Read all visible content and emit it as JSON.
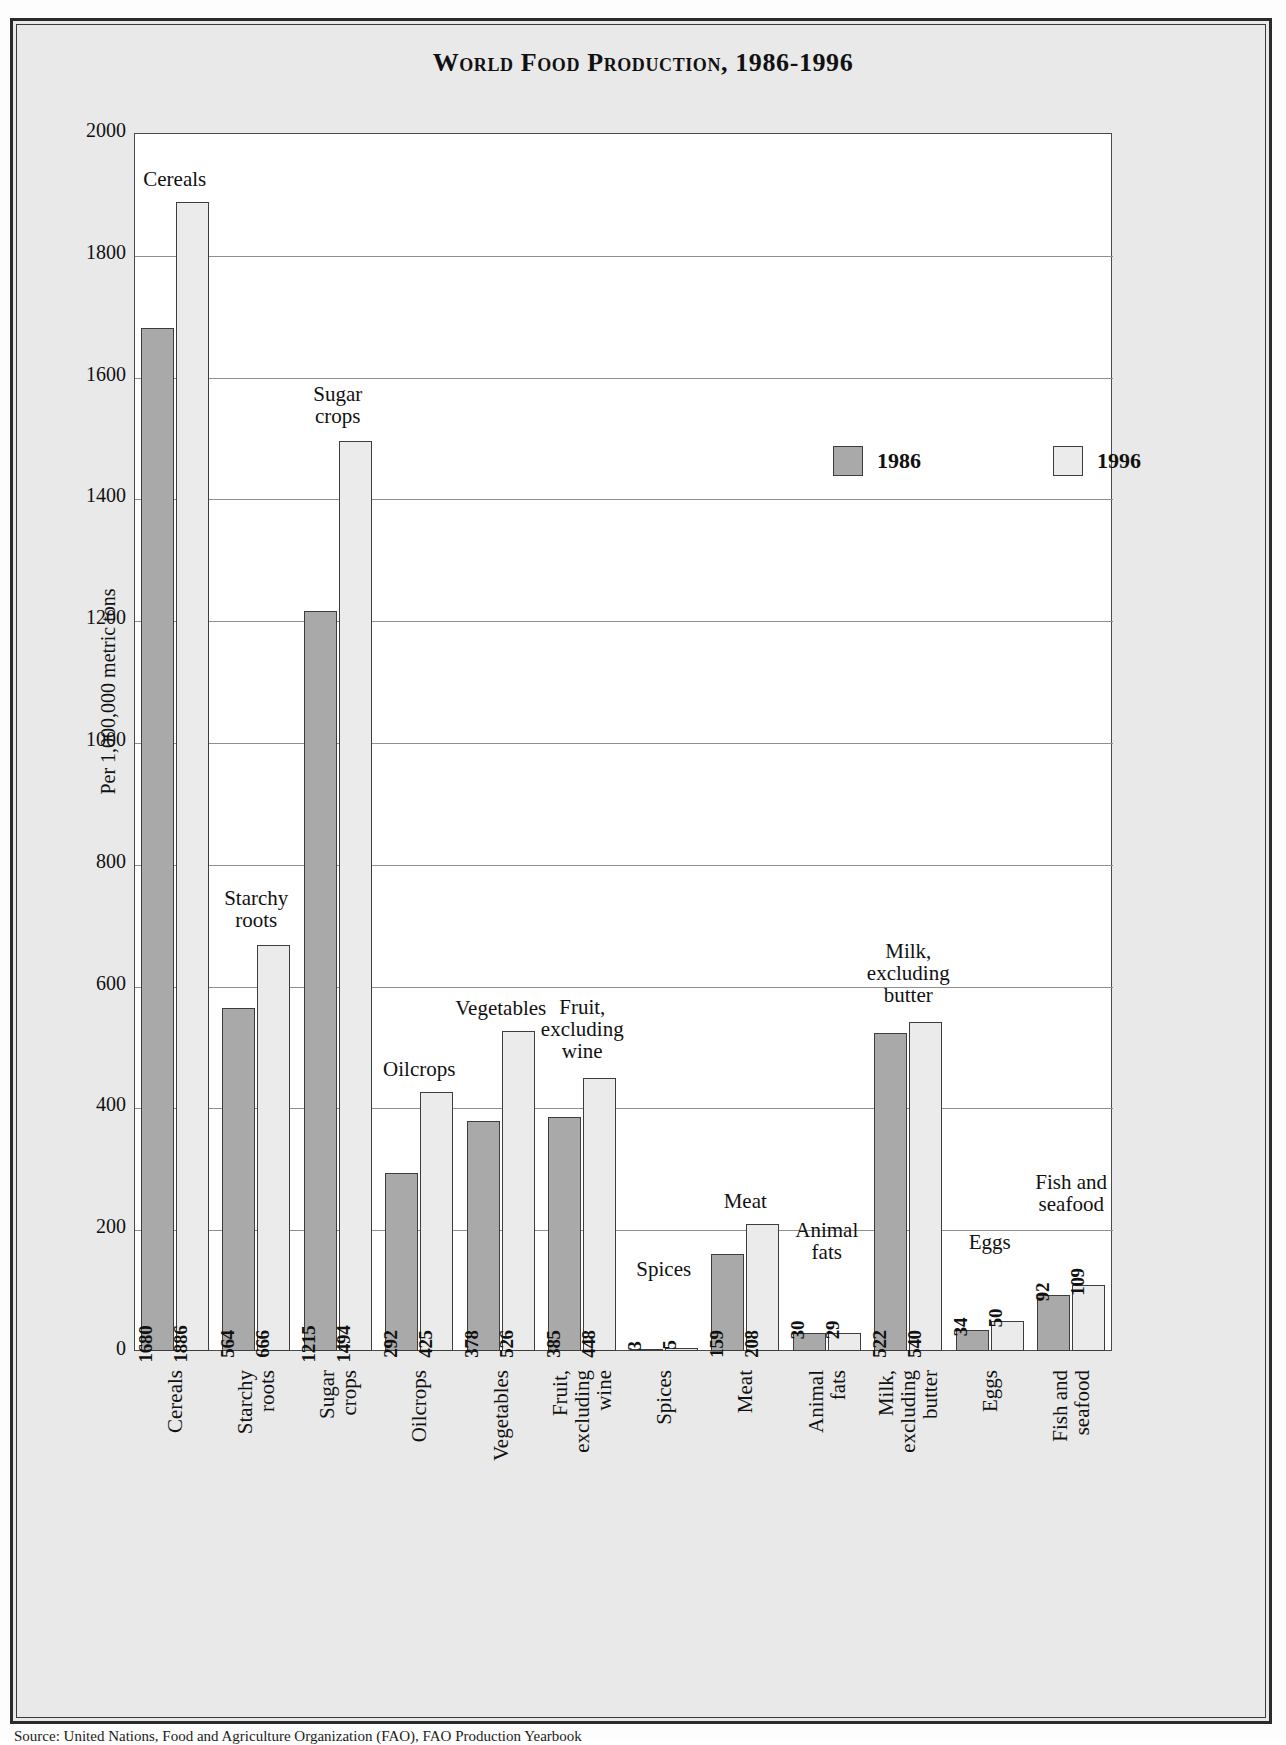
{
  "title": "World Food Production, 1986-1996",
  "source_caption": "Source: United Nations, Food and Agriculture Organization (FAO), FAO Production Yearbook",
  "legend": {
    "items": [
      {
        "label": "1986",
        "color": "#a9a9a9"
      },
      {
        "label": "1996",
        "color": "#ebebeb"
      }
    ]
  },
  "axis": {
    "y_title": "Per 1,000,000 metric tons",
    "y_ticks": [
      "2000",
      "1800",
      "1600",
      "1400",
      "1200",
      "1000",
      "800",
      "600",
      "400",
      "200",
      "0"
    ]
  },
  "chart_data": {
    "type": "bar",
    "title": "World Food Production, 1986-1996",
    "xlabel": "",
    "ylabel": "Per 1,000,000 metric tons",
    "ylim": [
      0,
      2000
    ],
    "ytick_step": 200,
    "grid": true,
    "legend_position": "upper-right-inside",
    "categories": [
      "Cereals",
      "Starchy roots",
      "Sugar crops",
      "Oilcrops",
      "Vegetables",
      "Fruit, excluding wine",
      "Spices",
      "Meat",
      "Animal fats",
      "Milk, excluding butter",
      "Eggs",
      "Fish and seafood"
    ],
    "category_labels_multiline": [
      "Cereals",
      "Starchy\nroots",
      "Sugar\ncrops",
      "Oilcrops",
      "Vegetables",
      "Fruit,\nexcluding\nwine",
      "Spices",
      "Meat",
      "Animal\nfats",
      "Milk,\nexcluding\nbutter",
      "Eggs",
      "Fish and\nseafood"
    ],
    "series": [
      {
        "name": "1986",
        "values": [
          1680,
          564,
          1215,
          292,
          378,
          385,
          3,
          159,
          30,
          522,
          34,
          92
        ]
      },
      {
        "name": "1996",
        "values": [
          1886,
          666,
          1494,
          425,
          526,
          448,
          5,
          208,
          29,
          540,
          50,
          109
        ]
      }
    ]
  }
}
